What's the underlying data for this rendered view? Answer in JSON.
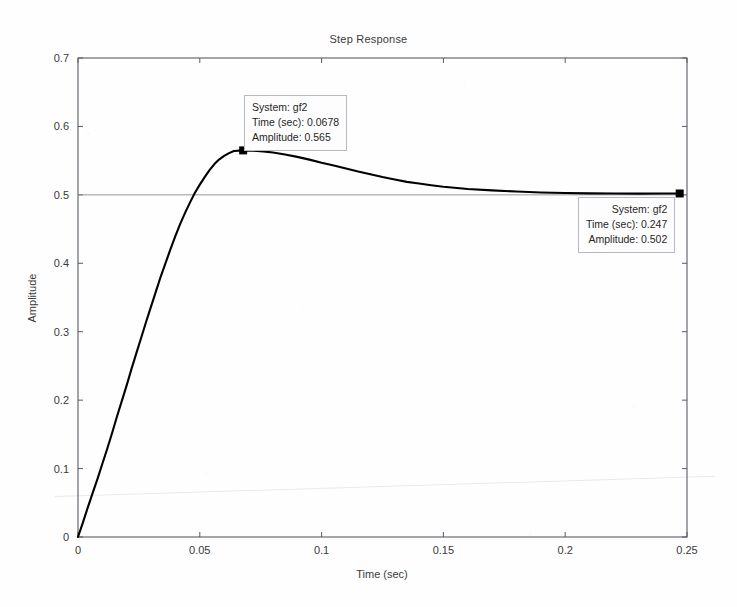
{
  "figure": {
    "title": "Step Response",
    "background_color": "#fefefe",
    "curve_color": "#000000",
    "axis_color": "#5a5a66",
    "reference_line_color": "#8a8a94",
    "datatip_border_color": "#b9b9c4",
    "datatip_fill_color": "#fdfdfd"
  },
  "datatips": [
    {
      "name": "peak",
      "system": "System: gf2",
      "time": "Time (sec): 0.0678",
      "amplitude": "Amplitude: 0.565",
      "marker_x": 0.0678,
      "marker_y": 0.565
    },
    {
      "name": "final",
      "system": "System: gf2",
      "time": "Time (sec): 0.247",
      "amplitude": "Amplitude: 0.502",
      "marker_x": 0.247,
      "marker_y": 0.502
    }
  ],
  "chart_data": {
    "type": "line",
    "title": "Step Response",
    "xlabel": "Time (sec)",
    "ylabel": "Amplitude",
    "xlim": [
      0,
      0.25
    ],
    "ylim": [
      0,
      0.7
    ],
    "xticks": [
      0,
      0.05,
      0.1,
      0.15,
      0.2,
      0.25
    ],
    "xticklabels": [
      "0",
      "0.05",
      "0.1",
      "0.15",
      "0.2",
      "0.25"
    ],
    "yticks": [
      0,
      0.1,
      0.2,
      0.3,
      0.4,
      0.5,
      0.6,
      0.7
    ],
    "yticklabels": [
      "0",
      "0.1",
      "0.2",
      "0.3",
      "0.4",
      "0.5",
      "0.6",
      "0.7"
    ],
    "grid": false,
    "legend": null,
    "reference_lines": [
      {
        "orientation": "horizontal",
        "value": 0.5,
        "label": "steady-state 0.5"
      }
    ],
    "annotations": [
      {
        "text": "System: gf2 / Time (sec): 0.0678 / Amplitude: 0.565",
        "x": 0.0678,
        "y": 0.565
      },
      {
        "text": "System: gf2 / Time (sec): 0.247 / Amplitude: 0.502",
        "x": 0.247,
        "y": 0.502
      }
    ],
    "series": [
      {
        "name": "gf2",
        "x": [
          0,
          0.002,
          0.004,
          0.006,
          0.008,
          0.01,
          0.012,
          0.014,
          0.016,
          0.018,
          0.02,
          0.022,
          0.024,
          0.026,
          0.028,
          0.03,
          0.032,
          0.034,
          0.036,
          0.038,
          0.04,
          0.042,
          0.044,
          0.046,
          0.048,
          0.05,
          0.052,
          0.054,
          0.056,
          0.058,
          0.06,
          0.062,
          0.064,
          0.0678,
          0.072,
          0.076,
          0.08,
          0.085,
          0.09,
          0.095,
          0.1,
          0.105,
          0.11,
          0.115,
          0.12,
          0.125,
          0.13,
          0.135,
          0.14,
          0.145,
          0.15,
          0.16,
          0.17,
          0.18,
          0.19,
          0.2,
          0.21,
          0.22,
          0.23,
          0.24,
          0.247
        ],
        "y": [
          0,
          0.021,
          0.043,
          0.064,
          0.085,
          0.107,
          0.129,
          0.152,
          0.176,
          0.199,
          0.222,
          0.246,
          0.269,
          0.292,
          0.315,
          0.337,
          0.359,
          0.381,
          0.401,
          0.421,
          0.44,
          0.458,
          0.474,
          0.489,
          0.503,
          0.515,
          0.526,
          0.536,
          0.545,
          0.552,
          0.557,
          0.561,
          0.564,
          0.565,
          0.5645,
          0.5635,
          0.562,
          0.559,
          0.5555,
          0.5515,
          0.547,
          0.543,
          0.5385,
          0.534,
          0.53,
          0.526,
          0.5225,
          0.519,
          0.5165,
          0.514,
          0.5118,
          0.5085,
          0.5065,
          0.5048,
          0.5035,
          0.5028,
          0.5022,
          0.5019,
          0.5018,
          0.5019,
          0.502
        ]
      }
    ]
  }
}
